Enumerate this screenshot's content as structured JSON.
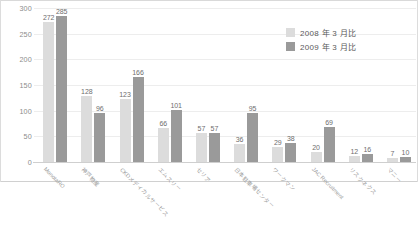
{
  "chart_data": {
    "type": "bar",
    "title": "",
    "subtitle": "",
    "xlabel": "",
    "ylabel": "",
    "ylim": [
      0,
      300
    ],
    "yticks": [
      "0",
      "50",
      "100",
      "150",
      "200",
      "250",
      "300"
    ],
    "grid": true,
    "legend_position": "top-right",
    "categories": [
      "MonotaRO",
      "神戸物産",
      "CKDメディカルサービス",
      "エムスリー",
      "セリア",
      "日本駐車場センター",
      "ワークマン",
      "JAC Recruitment",
      "リスクネクス",
      "マニー"
    ],
    "series": [
      {
        "name": "2008 年 3 月比",
        "color": "#dcdcdc",
        "values": [
          272,
          128,
          123,
          66,
          57,
          36,
          29,
          20,
          12,
          7
        ]
      },
      {
        "name": "2009 年 3 月比",
        "color": "#9a9a9a",
        "values": [
          285,
          96,
          166,
          101,
          57,
          95,
          38,
          69,
          16,
          10
        ]
      }
    ]
  },
  "legend": {
    "items": [
      {
        "label": "2008 年 3 月比"
      },
      {
        "label": "2009 年 3 月比"
      }
    ]
  }
}
